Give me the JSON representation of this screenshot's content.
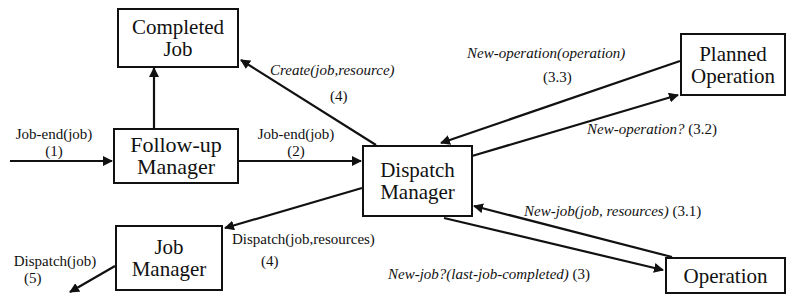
{
  "nodes": {
    "completed_job": {
      "line1": "Completed",
      "line2": "Job"
    },
    "followup_manager": {
      "line1": "Follow-up",
      "line2": "Manager"
    },
    "dispatch_manager": {
      "line1": "Dispatch",
      "line2": "Manager"
    },
    "job_manager": {
      "line1": "Job",
      "line2": "Manager"
    },
    "planned_operation": {
      "line1": "Planned",
      "line2": "Operation"
    },
    "operation": {
      "line1": "Operation"
    }
  },
  "edges": {
    "job_end_in": {
      "message": "Job-end(job)",
      "step": "(1)"
    },
    "job_end_to_dispatch": {
      "message": "Job-end(job)",
      "step": "(2)"
    },
    "create_completed": {
      "message": "Create(job,resource)",
      "step": "(4)"
    },
    "new_operation_reply": {
      "message": "New-operation(operation)",
      "step": "(3.3)"
    },
    "new_operation_query": {
      "message": "New-operation?",
      "step": "(3.2)"
    },
    "new_job_reply": {
      "message": "New-job(job, resources)",
      "step": "(3.1)"
    },
    "new_job_query": {
      "message": "New-job?(last-job-completed)",
      "step": "(3)"
    },
    "dispatch_to_job_manager": {
      "message": "Dispatch(job,resources)",
      "step": "(4)"
    },
    "dispatch_out": {
      "message": "Dispatch(job)",
      "step": "(5)"
    }
  }
}
